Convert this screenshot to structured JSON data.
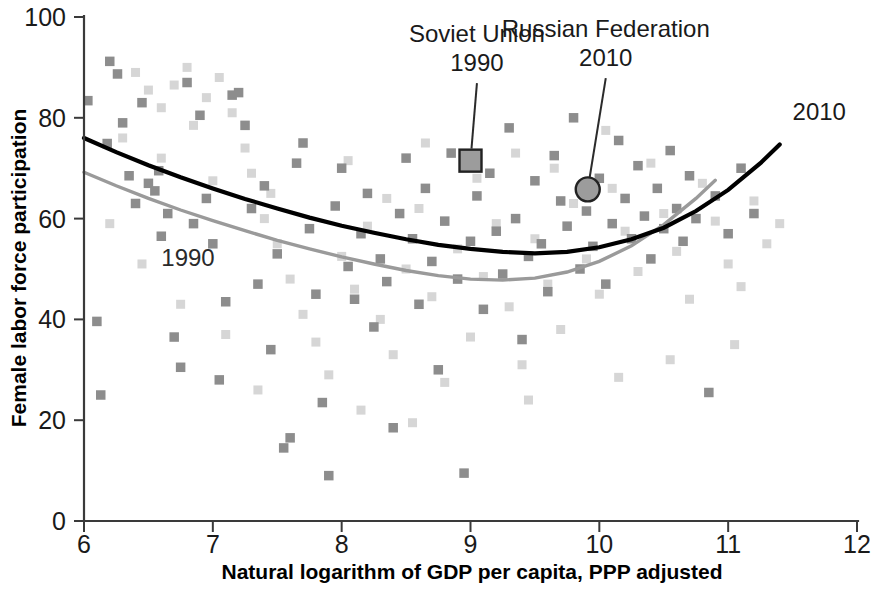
{
  "chart_data": {
    "type": "scatter",
    "title": "",
    "xlabel": "Natural logarithm of GDP per capita, PPP adjusted",
    "ylabel": "Female labor force participation",
    "xlim": [
      6,
      12
    ],
    "ylim": [
      0,
      100
    ],
    "xticks": [
      "6",
      "7",
      "8",
      "9",
      "10",
      "11",
      "12"
    ],
    "yticks": [
      "0",
      "20",
      "40",
      "60",
      "80",
      "100"
    ],
    "grid": false,
    "legend_position": "inline-curve-labels",
    "series": [
      {
        "name": "2010",
        "marker": "square",
        "color": "#8d8d8d",
        "fit_curve_color": "#000000",
        "fit_label": "2010",
        "fit_points": [
          [
            6.0,
            76.0
          ],
          [
            6.25,
            73.2
          ],
          [
            6.5,
            70.6
          ],
          [
            6.75,
            68.2
          ],
          [
            7.0,
            66.0
          ],
          [
            7.25,
            63.9
          ],
          [
            7.5,
            62.0
          ],
          [
            7.75,
            60.2
          ],
          [
            8.0,
            58.6
          ],
          [
            8.25,
            57.2
          ],
          [
            8.5,
            55.9
          ],
          [
            8.75,
            54.8
          ],
          [
            9.0,
            54.0
          ],
          [
            9.25,
            53.4
          ],
          [
            9.5,
            53.1
          ],
          [
            9.75,
            53.4
          ],
          [
            10.0,
            54.3
          ],
          [
            10.25,
            55.9
          ],
          [
            10.5,
            58.2
          ],
          [
            10.75,
            61.5
          ],
          [
            11.0,
            65.7
          ],
          [
            11.25,
            71.0
          ],
          [
            11.4,
            74.7
          ]
        ],
        "points": [
          [
            6.03,
            83.4
          ],
          [
            6.1,
            39.6
          ],
          [
            6.13,
            25.0
          ],
          [
            6.18,
            74.9
          ],
          [
            6.2,
            91.2
          ],
          [
            6.26,
            88.7
          ],
          [
            6.3,
            79.0
          ],
          [
            6.35,
            68.5
          ],
          [
            6.4,
            63.0
          ],
          [
            6.45,
            83.0
          ],
          [
            6.5,
            67.0
          ],
          [
            6.55,
            65.5
          ],
          [
            6.58,
            69.5
          ],
          [
            6.6,
            56.5
          ],
          [
            6.65,
            61.0
          ],
          [
            6.7,
            36.5
          ],
          [
            6.75,
            30.5
          ],
          [
            6.8,
            87.0
          ],
          [
            6.85,
            59.0
          ],
          [
            6.9,
            80.5
          ],
          [
            6.95,
            64.0
          ],
          [
            7.0,
            55.0
          ],
          [
            7.05,
            28.0
          ],
          [
            7.1,
            43.5
          ],
          [
            7.15,
            84.5
          ],
          [
            7.2,
            85.0
          ],
          [
            7.25,
            78.5
          ],
          [
            7.3,
            62.0
          ],
          [
            7.35,
            47.0
          ],
          [
            7.4,
            66.5
          ],
          [
            7.45,
            34.0
          ],
          [
            7.5,
            53.0
          ],
          [
            7.55,
            14.5
          ],
          [
            7.6,
            16.5
          ],
          [
            7.65,
            71.0
          ],
          [
            7.7,
            75.0
          ],
          [
            7.75,
            58.0
          ],
          [
            7.8,
            45.0
          ],
          [
            7.85,
            23.5
          ],
          [
            7.9,
            9.0
          ],
          [
            7.95,
            62.5
          ],
          [
            8.0,
            70.0
          ],
          [
            8.05,
            50.5
          ],
          [
            8.1,
            44.0
          ],
          [
            8.15,
            57.0
          ],
          [
            8.2,
            65.0
          ],
          [
            8.25,
            38.5
          ],
          [
            8.3,
            52.0
          ],
          [
            8.35,
            47.5
          ],
          [
            8.4,
            18.5
          ],
          [
            8.45,
            61.0
          ],
          [
            8.5,
            72.0
          ],
          [
            8.55,
            56.0
          ],
          [
            8.6,
            43.0
          ],
          [
            8.65,
            66.0
          ],
          [
            8.7,
            51.5
          ],
          [
            8.75,
            30.0
          ],
          [
            8.8,
            59.5
          ],
          [
            8.85,
            73.0
          ],
          [
            8.9,
            48.0
          ],
          [
            8.95,
            9.5
          ],
          [
            9.0,
            55.5
          ],
          [
            9.05,
            64.5
          ],
          [
            9.1,
            42.0
          ],
          [
            9.15,
            69.0
          ],
          [
            9.2,
            57.5
          ],
          [
            9.25,
            49.0
          ],
          [
            9.3,
            78.0
          ],
          [
            9.35,
            60.0
          ],
          [
            9.4,
            36.0
          ],
          [
            9.45,
            52.5
          ],
          [
            9.5,
            67.5
          ],
          [
            9.55,
            55.0
          ],
          [
            9.6,
            45.5
          ],
          [
            9.65,
            72.5
          ],
          [
            9.7,
            63.5
          ],
          [
            9.75,
            58.5
          ],
          [
            9.8,
            80.0
          ],
          [
            9.85,
            50.0
          ],
          [
            9.9,
            61.5
          ],
          [
            9.95,
            54.5
          ],
          [
            10.0,
            68.0
          ],
          [
            10.05,
            47.0
          ],
          [
            10.1,
            59.0
          ],
          [
            10.15,
            75.5
          ],
          [
            10.2,
            64.0
          ],
          [
            10.25,
            56.0
          ],
          [
            10.3,
            70.5
          ],
          [
            10.35,
            60.5
          ],
          [
            10.4,
            52.0
          ],
          [
            10.45,
            66.0
          ],
          [
            10.5,
            58.0
          ],
          [
            10.55,
            73.5
          ],
          [
            10.6,
            62.0
          ],
          [
            10.65,
            55.5
          ],
          [
            10.7,
            68.5
          ],
          [
            10.75,
            60.0
          ],
          [
            10.85,
            25.5
          ],
          [
            10.9,
            64.5
          ],
          [
            11.0,
            57.0
          ],
          [
            11.1,
            70.0
          ],
          [
            11.2,
            61.0
          ]
        ]
      },
      {
        "name": "1990",
        "marker": "square",
        "color": "#d6d6d6",
        "fit_curve_color": "#9a9a9a",
        "fit_label": "1990",
        "fit_points": [
          [
            6.0,
            69.2
          ],
          [
            6.25,
            66.5
          ],
          [
            6.5,
            64.0
          ],
          [
            6.75,
            61.7
          ],
          [
            7.0,
            59.6
          ],
          [
            7.25,
            57.6
          ],
          [
            7.5,
            55.7
          ],
          [
            7.75,
            54.0
          ],
          [
            8.0,
            52.4
          ],
          [
            8.25,
            51.0
          ],
          [
            8.5,
            49.7
          ],
          [
            8.75,
            48.7
          ],
          [
            9.0,
            48.0
          ],
          [
            9.25,
            47.8
          ],
          [
            9.5,
            48.2
          ],
          [
            9.75,
            49.4
          ],
          [
            10.0,
            51.5
          ],
          [
            10.25,
            54.6
          ],
          [
            10.5,
            58.8
          ],
          [
            10.75,
            64.0
          ],
          [
            10.9,
            67.6
          ]
        ],
        "points": [
          [
            6.4,
            89.0
          ],
          [
            6.5,
            85.5
          ],
          [
            6.6,
            82.0
          ],
          [
            6.7,
            86.5
          ],
          [
            6.8,
            90.0
          ],
          [
            6.85,
            78.5
          ],
          [
            6.95,
            84.0
          ],
          [
            7.05,
            88.0
          ],
          [
            7.15,
            81.0
          ],
          [
            7.25,
            74.0
          ],
          [
            7.3,
            69.0
          ],
          [
            7.4,
            60.0
          ],
          [
            7.5,
            55.0
          ],
          [
            7.6,
            48.0
          ],
          [
            7.7,
            41.0
          ],
          [
            7.8,
            35.5
          ],
          [
            7.9,
            29.0
          ],
          [
            8.0,
            52.5
          ],
          [
            8.1,
            46.0
          ],
          [
            8.2,
            58.5
          ],
          [
            8.3,
            40.0
          ],
          [
            8.4,
            33.0
          ],
          [
            8.5,
            50.0
          ],
          [
            8.6,
            62.0
          ],
          [
            8.7,
            44.5
          ],
          [
            8.8,
            27.5
          ],
          [
            8.9,
            54.0
          ],
          [
            9.0,
            36.5
          ],
          [
            9.1,
            48.5
          ],
          [
            9.2,
            59.0
          ],
          [
            9.3,
            42.5
          ],
          [
            9.4,
            31.0
          ],
          [
            9.5,
            56.0
          ],
          [
            9.6,
            47.0
          ],
          [
            9.7,
            38.0
          ],
          [
            9.8,
            63.0
          ],
          [
            9.9,
            52.0
          ],
          [
            10.0,
            45.0
          ],
          [
            10.1,
            66.0
          ],
          [
            10.2,
            57.5
          ],
          [
            10.3,
            49.5
          ],
          [
            10.4,
            71.0
          ],
          [
            10.5,
            61.0
          ],
          [
            10.6,
            53.5
          ],
          [
            10.7,
            44.0
          ],
          [
            10.8,
            67.0
          ],
          [
            10.9,
            59.5
          ],
          [
            11.0,
            51.0
          ],
          [
            11.1,
            46.5
          ],
          [
            11.2,
            63.5
          ],
          [
            11.3,
            55.0
          ],
          [
            11.4,
            59.0
          ],
          [
            6.3,
            76.0
          ],
          [
            6.6,
            72.0
          ],
          [
            7.0,
            67.5
          ],
          [
            7.45,
            65.0
          ],
          [
            8.05,
            71.5
          ],
          [
            8.35,
            64.0
          ],
          [
            8.65,
            75.0
          ],
          [
            9.05,
            68.0
          ],
          [
            9.35,
            73.0
          ],
          [
            9.65,
            70.0
          ],
          [
            10.05,
            77.5
          ],
          [
            6.2,
            59.0
          ],
          [
            6.45,
            51.0
          ],
          [
            6.75,
            43.0
          ],
          [
            7.1,
            37.0
          ],
          [
            7.35,
            26.0
          ],
          [
            8.15,
            22.0
          ],
          [
            8.55,
            19.5
          ],
          [
            9.45,
            24.0
          ],
          [
            10.15,
            28.5
          ],
          [
            10.55,
            32.0
          ],
          [
            11.05,
            35.0
          ]
        ]
      }
    ],
    "annotations": [
      {
        "id": "soviet-union",
        "label_line1": "Soviet Union",
        "label_line2": "1990",
        "marker": "square",
        "point": [
          9.0,
          71.5
        ],
        "label_x": 9.05,
        "label_y": 95.0
      },
      {
        "id": "russian-federation",
        "label_line1": "Russian Federation",
        "label_line2": "2010",
        "marker": "circle",
        "point": [
          9.91,
          65.8
        ],
        "label_x": 10.05,
        "label_y": 96.0
      }
    ],
    "curve_labels": [
      {
        "text": "2010",
        "x": 11.5,
        "y": 79.5,
        "color": "#1a1a1a"
      },
      {
        "text": "1990",
        "x": 6.6,
        "y": 50.5,
        "color": "#2a2a2a"
      }
    ]
  }
}
